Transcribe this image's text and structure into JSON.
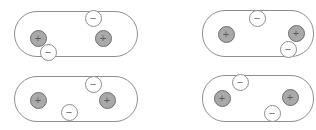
{
  "figure": {
    "width": 316,
    "height": 130,
    "background_color": "#ffffff",
    "capsule": {
      "outline_color": "#8d8d8d",
      "fill_color": "#ffffff",
      "border_width": 1
    },
    "charge_styles": {
      "positive": {
        "symbol": "+",
        "fill_color": "#a9a9a9",
        "outline_color": "#6e6e6e",
        "text_color": "#5a5a5a",
        "diameter": 17
      },
      "negative": {
        "symbol": "−",
        "fill_color": "#ffffff",
        "outline_color": "#8d8d8d",
        "text_color": "#6a6a6a",
        "diameter": 17
      }
    },
    "panels": [
      {
        "name": "panel-top-left",
        "label": "Top left conductor",
        "x": 14,
        "y": 11,
        "width": 124,
        "height": 46,
        "radius": 23,
        "charges": [
          {
            "name": "charge-positive-left",
            "sign": "positive",
            "symbol": "+",
            "cx": 38,
            "cy": 38
          },
          {
            "name": "charge-negative-lower",
            "sign": "negative",
            "symbol": "−",
            "cx": 48,
            "cy": 52
          },
          {
            "name": "charge-negative-upper",
            "sign": "negative",
            "symbol": "−",
            "cx": 93,
            "cy": 18
          },
          {
            "name": "charge-positive-right",
            "sign": "positive",
            "symbol": "+",
            "cx": 103,
            "cy": 38
          }
        ]
      },
      {
        "name": "panel-top-right",
        "label": "Top right conductor",
        "x": 202,
        "y": 10,
        "width": 112,
        "height": 47,
        "radius": 23,
        "charges": [
          {
            "name": "charge-positive-left",
            "sign": "positive",
            "symbol": "+",
            "cx": 226,
            "cy": 34
          },
          {
            "name": "charge-negative-upper",
            "sign": "negative",
            "symbol": "−",
            "cx": 257,
            "cy": 18
          },
          {
            "name": "charge-positive-right",
            "sign": "positive",
            "symbol": "+",
            "cx": 296,
            "cy": 33
          },
          {
            "name": "charge-negative-lower",
            "sign": "negative",
            "symbol": "−",
            "cx": 288,
            "cy": 49
          }
        ]
      },
      {
        "name": "panel-bottom-left",
        "label": "Bottom left conductor",
        "x": 14,
        "y": 76,
        "width": 124,
        "height": 46,
        "radius": 23,
        "charges": [
          {
            "name": "charge-positive-left",
            "sign": "positive",
            "symbol": "+",
            "cx": 38,
            "cy": 100
          },
          {
            "name": "charge-negative-bottom",
            "sign": "negative",
            "symbol": "−",
            "cx": 69,
            "cy": 112
          },
          {
            "name": "charge-negative-upper",
            "sign": "negative",
            "symbol": "−",
            "cx": 93,
            "cy": 84
          },
          {
            "name": "charge-positive-right",
            "sign": "positive",
            "symbol": "+",
            "cx": 107,
            "cy": 100
          }
        ]
      },
      {
        "name": "panel-bottom-right",
        "label": "Bottom right conductor",
        "x": 202,
        "y": 75,
        "width": 112,
        "height": 47,
        "radius": 23,
        "charges": [
          {
            "name": "charge-negative-upper",
            "sign": "negative",
            "symbol": "−",
            "cx": 240,
            "cy": 82
          },
          {
            "name": "charge-positive-left",
            "sign": "positive",
            "symbol": "+",
            "cx": 222,
            "cy": 98
          },
          {
            "name": "charge-positive-right",
            "sign": "positive",
            "symbol": "+",
            "cx": 290,
            "cy": 97
          },
          {
            "name": "charge-negative-lower",
            "sign": "negative",
            "symbol": "−",
            "cx": 272,
            "cy": 113
          }
        ]
      }
    ]
  }
}
